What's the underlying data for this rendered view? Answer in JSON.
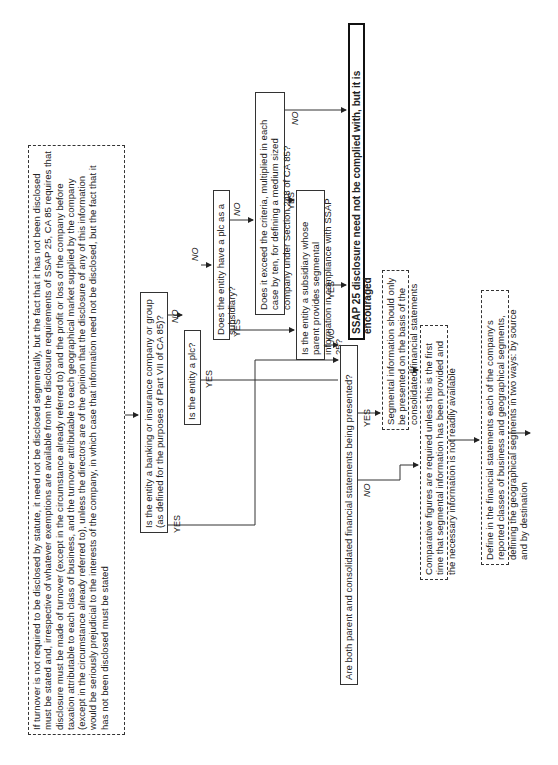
{
  "flowchart": {
    "turnover_note": "If turnover is not required to be disclosed by statute, it need not be disclosed segmentally, but the fact that it has not been disclosed must be stated and, irrespective of whatever exemptions are available from the disclosure requirements of SSAP 25, CA 85 requires that disclosure must be made of turnover (except in the circumstance already referred to) and the profit or loss of the company before taxation attributable to each class of business, and the turnover attributable to each geographical market supplied by the company (except in the circumstance already referred to), unless the directors are of the opinion that the disclosure of any of this information would be seriously prejudicial to the interests of the company, in which case that information need not be disclosed, but the fact that it has not been disclosed must be stated",
    "q_banking": "Is the entity a banking or insurance company or group (as defined for the purposes of Part VII of CA 85)?",
    "q_plc": "Is the entity a plc?",
    "q_subsidiary": "Does the entity have a plc as a subsidiary?",
    "q_criteria": "Does it exceed the criteria, multiplied in each case by ten, for defining a medium sized company under Section 248 of CA 85?",
    "q_parent_segmental": "Is the entity a subsidiary whose parent provides segmental information in compliance with SSAP 25?",
    "q_both_statements": "Are both parent and consolidated financial statements being presented?",
    "outcome_not_required": "SSAP 25 disclosure need not be complied with, but it is encouraged",
    "note_consolidated": "Segmental information should only be presented on the basis of the consolidated financial statements",
    "note_comparative": "Comparative figures are required unless this is the first time that segmental information has been provided and the necessary information is not readily available",
    "note_define": "Define in the financial statements each of the company's reported classes of business and geographical segments, defining the geographical segments in two ways: by source and by destination",
    "labels": {
      "yes": "YES",
      "no": "NO"
    }
  }
}
